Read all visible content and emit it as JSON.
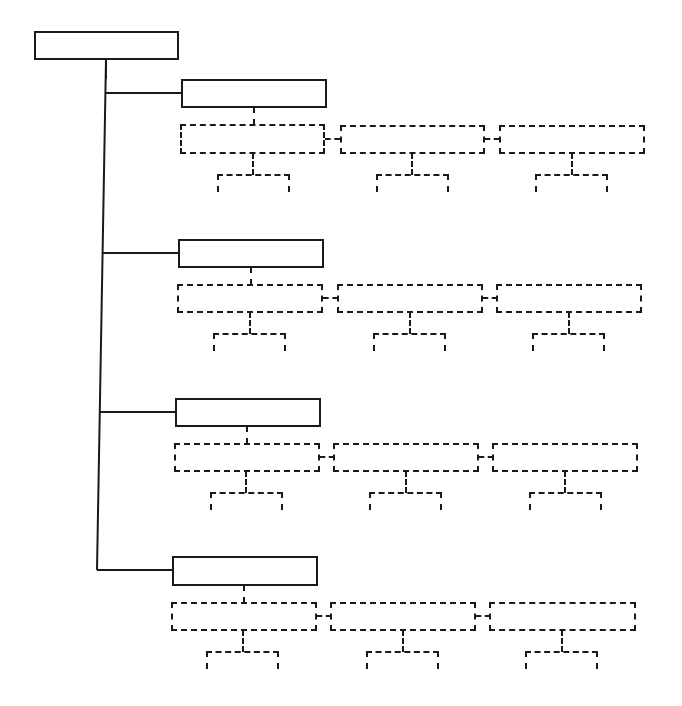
{
  "diagram": {
    "title": "",
    "root": {
      "label": ""
    },
    "branches": [
      {
        "label": "",
        "children": [
          {
            "label": ""
          },
          {
            "label": ""
          },
          {
            "label": ""
          }
        ]
      },
      {
        "label": "",
        "children": [
          {
            "label": ""
          },
          {
            "label": ""
          },
          {
            "label": ""
          }
        ]
      },
      {
        "label": "",
        "children": [
          {
            "label": ""
          },
          {
            "label": ""
          },
          {
            "label": ""
          }
        ]
      },
      {
        "label": "",
        "children": [
          {
            "label": ""
          },
          {
            "label": ""
          },
          {
            "label": ""
          }
        ]
      }
    ]
  },
  "colors": {
    "line": "#1a1a1a",
    "background": "#ffffff"
  }
}
